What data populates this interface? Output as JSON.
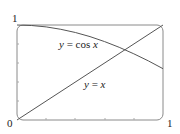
{
  "chart_data": {
    "type": "line",
    "title": "",
    "xlabel": "",
    "ylabel": "",
    "xlim": [
      0,
      1
    ],
    "ylim": [
      0,
      1
    ],
    "x_tick_labels": [
      "0",
      "1"
    ],
    "y_tick_labels": [
      "1"
    ],
    "grid": false,
    "series": [
      {
        "name": "y = cos x",
        "x": [
          0,
          0.1,
          0.2,
          0.3,
          0.4,
          0.5,
          0.6,
          0.7,
          0.8,
          0.9,
          1.0
        ],
        "values": [
          1.0,
          0.995,
          0.98,
          0.955,
          0.921,
          0.878,
          0.825,
          0.765,
          0.697,
          0.622,
          0.54
        ]
      },
      {
        "name": "y = x",
        "x": [
          0,
          1
        ],
        "values": [
          0,
          1
        ]
      }
    ],
    "annotations": [
      "y = cos x",
      "y = x"
    ]
  },
  "labels": {
    "origin": "0",
    "x_max": "1",
    "y_max": "1",
    "cos_label_prefix": "y",
    "cos_label_eq": " = cos ",
    "cos_label_var": "x",
    "line_label_prefix": "y",
    "line_label_eq": " = ",
    "line_label_var": "x"
  },
  "colors": {
    "frame": "#888888",
    "curve": "#444444"
  }
}
